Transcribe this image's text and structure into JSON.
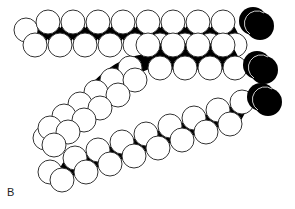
{
  "figure": {
    "panel_label": "B",
    "colors": {
      "atom_fill": "#ffffff",
      "atom_stroke": "#333333",
      "backbone": "#000000",
      "head": "#000000"
    },
    "atom_radius": 12,
    "chains": [
      {
        "name": "chain-1-top",
        "upper": [
          [
            48,
            22
          ],
          [
            73,
            22
          ],
          [
            98,
            22
          ],
          [
            123,
            22
          ],
          [
            148,
            22
          ],
          [
            173,
            22
          ],
          [
            198,
            22
          ],
          [
            223,
            22
          ]
        ],
        "lower": [
          [
            35,
            45
          ],
          [
            60,
            45
          ],
          [
            85,
            45
          ],
          [
            110,
            45
          ],
          [
            135,
            45
          ],
          [
            160,
            45
          ],
          [
            185,
            45
          ],
          [
            210,
            45
          ],
          [
            235,
            45
          ]
        ],
        "terminal": [
          [
            26,
            30
          ]
        ],
        "head": [
          [
            258,
            24
          ]
        ]
      },
      {
        "name": "chain-2-bent",
        "upper": [
          [
            148,
            45
          ],
          [
            173,
            45
          ],
          [
            198,
            45
          ],
          [
            223,
            45
          ]
        ],
        "lower": [
          [
            160,
            68
          ],
          [
            185,
            68
          ],
          [
            210,
            68
          ],
          [
            235,
            68
          ]
        ],
        "bend": [
          [
            130,
            68
          ],
          [
            112,
            80
          ],
          [
            96,
            92
          ],
          [
            80,
            104
          ],
          [
            64,
            116
          ],
          [
            50,
            128
          ]
        ],
        "bend_lower": [
          [
            135,
            80
          ],
          [
            118,
            95
          ],
          [
            100,
            108
          ],
          [
            84,
            120
          ],
          [
            68,
            132
          ],
          [
            54,
            145
          ]
        ],
        "arc": [
          [
            100,
            82
          ],
          [
            165,
            60
          ]
        ],
        "terminal": [
          [
            45,
            138
          ]
        ],
        "head": [
          [
            262,
            68
          ]
        ]
      },
      {
        "name": "chain-3-diagonal",
        "upper": [
          [
            75,
            158
          ],
          [
            98,
            150
          ],
          [
            122,
            142
          ],
          [
            146,
            134
          ],
          [
            170,
            126
          ],
          [
            194,
            118
          ],
          [
            218,
            110
          ],
          [
            242,
            102
          ]
        ],
        "lower": [
          [
            62,
            180
          ],
          [
            86,
            172
          ],
          [
            110,
            164
          ],
          [
            134,
            156
          ],
          [
            158,
            148
          ],
          [
            182,
            140
          ],
          [
            206,
            132
          ],
          [
            230,
            124
          ]
        ],
        "terminal": [
          [
            50,
            172
          ]
        ],
        "head": [
          [
            266,
            100
          ]
        ]
      }
    ]
  }
}
